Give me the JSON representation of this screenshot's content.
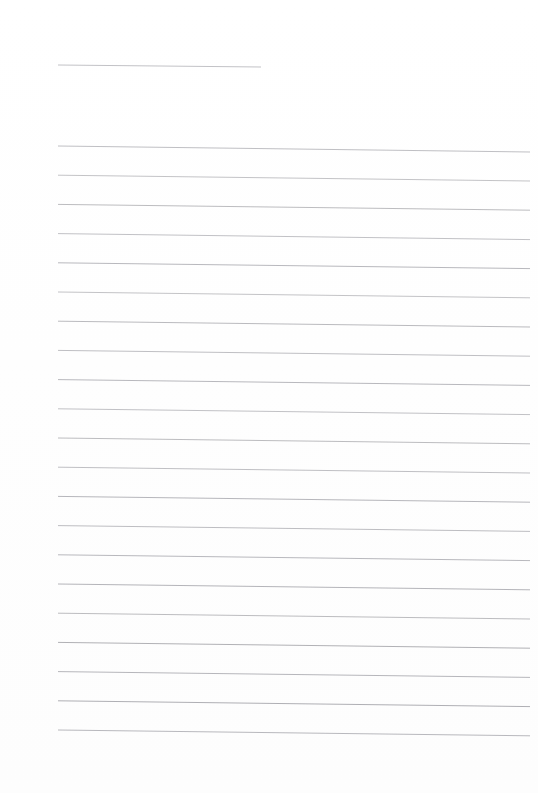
{
  "page": {
    "kind": "scanned-lined-paper",
    "width": 538,
    "height": 793,
    "background_color": "#ffffff",
    "visible_text": "",
    "title_text": ""
  },
  "ink": {
    "rule_color": "#b4b4b8",
    "rule_color_dark": "#9a9aa0",
    "rule_color_light": "#d8d8dc",
    "header_rule_color": "#c2c2c6"
  },
  "header_rule": {
    "name": "header-rule",
    "x1": 58,
    "y1": 65,
    "x2": 261,
    "y2": 67,
    "thickness": 1.0,
    "color": "#c2c2c6"
  },
  "ruled_lines": {
    "count": 21,
    "left_x": 58,
    "right_x": 530,
    "left_start_y": 146,
    "spacing": 29.2,
    "right_drop": 6,
    "thickness": 0.9,
    "lines": [
      {
        "index": 1,
        "x1": 58,
        "y1": 146.0,
        "x2": 530,
        "y2": 152.0,
        "color": "#b8b8bc"
      },
      {
        "index": 2,
        "x1": 58,
        "y1": 175.2,
        "x2": 530,
        "y2": 181.0,
        "color": "#bcbcc0"
      },
      {
        "index": 3,
        "x1": 58,
        "y1": 204.4,
        "x2": 530,
        "y2": 210.2,
        "color": "#b4b4b8"
      },
      {
        "index": 4,
        "x1": 58,
        "y1": 233.6,
        "x2": 530,
        "y2": 239.6,
        "color": "#bababe"
      },
      {
        "index": 5,
        "x1": 58,
        "y1": 262.8,
        "x2": 530,
        "y2": 268.6,
        "color": "#b0b0b5"
      },
      {
        "index": 6,
        "x1": 58,
        "y1": 292.0,
        "x2": 530,
        "y2": 297.8,
        "color": "#bcbcc0"
      },
      {
        "index": 7,
        "x1": 58,
        "y1": 321.2,
        "x2": 530,
        "y2": 327.0,
        "color": "#b2b2b7"
      },
      {
        "index": 8,
        "x1": 58,
        "y1": 350.4,
        "x2": 530,
        "y2": 356.2,
        "color": "#b8b8bc"
      },
      {
        "index": 9,
        "x1": 58,
        "y1": 379.6,
        "x2": 530,
        "y2": 385.4,
        "color": "#b0b0b5"
      },
      {
        "index": 10,
        "x1": 58,
        "y1": 408.8,
        "x2": 530,
        "y2": 414.6,
        "color": "#bababe"
      },
      {
        "index": 11,
        "x1": 58,
        "y1": 438.0,
        "x2": 530,
        "y2": 443.8,
        "color": "#b4b4b8"
      },
      {
        "index": 12,
        "x1": 58,
        "y1": 467.2,
        "x2": 530,
        "y2": 473.0,
        "color": "#b8b8bc"
      },
      {
        "index": 13,
        "x1": 58,
        "y1": 496.4,
        "x2": 530,
        "y2": 502.2,
        "color": "#aeaeb3"
      },
      {
        "index": 14,
        "x1": 58,
        "y1": 525.6,
        "x2": 530,
        "y2": 531.4,
        "color": "#b6b6ba"
      },
      {
        "index": 15,
        "x1": 58,
        "y1": 554.8,
        "x2": 530,
        "y2": 560.6,
        "color": "#b0b0b5"
      },
      {
        "index": 16,
        "x1": 58,
        "y1": 584.0,
        "x2": 530,
        "y2": 589.8,
        "color": "#acacb1"
      },
      {
        "index": 17,
        "x1": 58,
        "y1": 613.2,
        "x2": 530,
        "y2": 619.0,
        "color": "#b4b4b8"
      },
      {
        "index": 18,
        "x1": 58,
        "y1": 642.4,
        "x2": 530,
        "y2": 648.2,
        "color": "#a8a8ad"
      },
      {
        "index": 19,
        "x1": 58,
        "y1": 671.6,
        "x2": 530,
        "y2": 677.4,
        "color": "#aeaeb3"
      },
      {
        "index": 20,
        "x1": 58,
        "y1": 700.8,
        "x2": 530,
        "y2": 706.6,
        "color": "#a6a6ab"
      },
      {
        "index": 21,
        "x1": 58,
        "y1": 730.0,
        "x2": 530,
        "y2": 735.8,
        "color": "#b0b0b5"
      }
    ]
  }
}
